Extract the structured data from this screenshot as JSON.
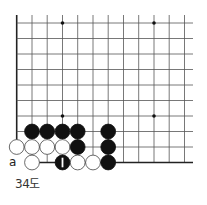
{
  "diagram": {
    "type": "go-board-diagram",
    "caption": "34도",
    "label_a": "a",
    "grid": {
      "x_lines": [
        16.7,
        32,
        47.2,
        62.5,
        77.7,
        93,
        108.2,
        123.5,
        138.7,
        154,
        169.2,
        184.5
      ],
      "y_lines": [
        23,
        38.5,
        54,
        69.5,
        85,
        100.5,
        116,
        131.5,
        147,
        162.5
      ],
      "top_extent": 15,
      "right_extent": 193,
      "left_edge_bottom": 147,
      "bottom_edge_left": 32,
      "line_color": "#555555",
      "edge_color": "#222222"
    },
    "star_points": [
      [
        62.5,
        23
      ],
      [
        154,
        23
      ],
      [
        62.5,
        116
      ],
      [
        154,
        116
      ]
    ],
    "stones": [
      {
        "color": "black",
        "x": 32,
        "y": 131.5
      },
      {
        "color": "black",
        "x": 47.2,
        "y": 131.5
      },
      {
        "color": "black",
        "x": 62.5,
        "y": 131.5
      },
      {
        "color": "black",
        "x": 77.7,
        "y": 131.5
      },
      {
        "color": "black",
        "x": 108.2,
        "y": 131.5
      },
      {
        "color": "white",
        "x": 16.7,
        "y": 147
      },
      {
        "color": "white",
        "x": 32,
        "y": 147
      },
      {
        "color": "white",
        "x": 47.2,
        "y": 147
      },
      {
        "color": "white",
        "x": 62.5,
        "y": 147
      },
      {
        "color": "black",
        "x": 77.7,
        "y": 147
      },
      {
        "color": "black",
        "x": 108.2,
        "y": 147
      },
      {
        "color": "white",
        "x": 32,
        "y": 162.5
      },
      {
        "color": "black",
        "x": 62.5,
        "y": 162.5,
        "number": "1"
      },
      {
        "color": "white",
        "x": 77.7,
        "y": 162.5
      },
      {
        "color": "white",
        "x": 93,
        "y": 162.5
      },
      {
        "color": "black",
        "x": 108.2,
        "y": 162.5
      }
    ],
    "stone_radius": 7.4,
    "colors": {
      "black": "#111111",
      "white": "#ffffff",
      "white_stroke": "#444444"
    }
  }
}
